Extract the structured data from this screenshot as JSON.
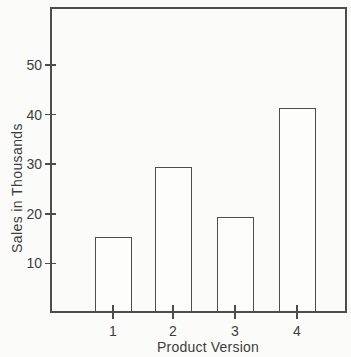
{
  "chart_data": {
    "type": "bar",
    "categories": [
      "1",
      "2",
      "3",
      "4"
    ],
    "values": [
      15,
      29,
      19,
      41
    ],
    "title": "",
    "xlabel": "Product Version",
    "ylabel": "Sales in Thousands",
    "ylim": [
      0,
      62
    ],
    "yticks": [
      10,
      20,
      30,
      40,
      50
    ],
    "grid": false,
    "legend": "none",
    "bar_style": "outlined-unfilled",
    "colors": {
      "line": "#4d4d4d",
      "text": "#3d3d3d",
      "bar_fill": "#fdfdfc",
      "background": "#fbfbfa"
    }
  }
}
